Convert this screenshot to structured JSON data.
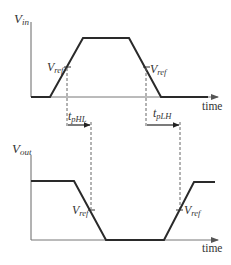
{
  "diagram": {
    "top_panel": {
      "y_axis_label": {
        "main": "V",
        "sub": "in"
      },
      "x_axis_label": "time",
      "waveform": "input pulse: low → rising edge → high → falling edge → low",
      "ref_labels": [
        {
          "main": "V",
          "sub": "ref",
          "edge": "rising"
        },
        {
          "main": "V",
          "sub": "ref",
          "edge": "falling"
        }
      ]
    },
    "bottom_panel": {
      "y_axis_label": {
        "main": "V",
        "sub": "out"
      },
      "x_axis_label": "time",
      "waveform": "output pulse (inverted): high → falling edge → low → rising edge → high",
      "ref_labels": [
        {
          "main": "V",
          "sub": "ref",
          "edge": "falling"
        },
        {
          "main": "V",
          "sub": "ref",
          "edge": "rising"
        }
      ]
    },
    "delays": [
      {
        "main": "t",
        "sub": "pHL",
        "description": "high-to-low propagation delay"
      },
      {
        "main": "t",
        "sub": "pLH",
        "description": "low-to-high propagation delay"
      }
    ],
    "colors": {
      "waveform": "#2a2a2a",
      "axis": "#555555",
      "dashed": "#666666",
      "text": "#333333"
    }
  }
}
